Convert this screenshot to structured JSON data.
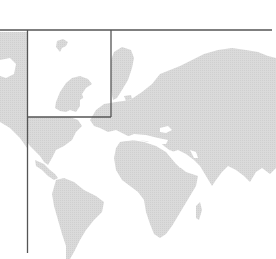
{
  "map": {
    "type": "world-map",
    "land_color": "#d6d6d6",
    "frame_color": "#555555",
    "background": "#ffffff",
    "frame": {
      "top_line_y": 30,
      "left_line_x": 27,
      "left_line_bottom_y": 253,
      "top_line_left_x": 0,
      "top_line_right_x": 272
    },
    "inset_box": {
      "label": "highlighted-region-scandinavia",
      "x": 27,
      "y": 30,
      "width": 84,
      "height": 87
    },
    "regions": [
      "North America",
      "South America",
      "Greenland",
      "Europe",
      "Africa",
      "Asia",
      "Middle East",
      "India"
    ]
  }
}
